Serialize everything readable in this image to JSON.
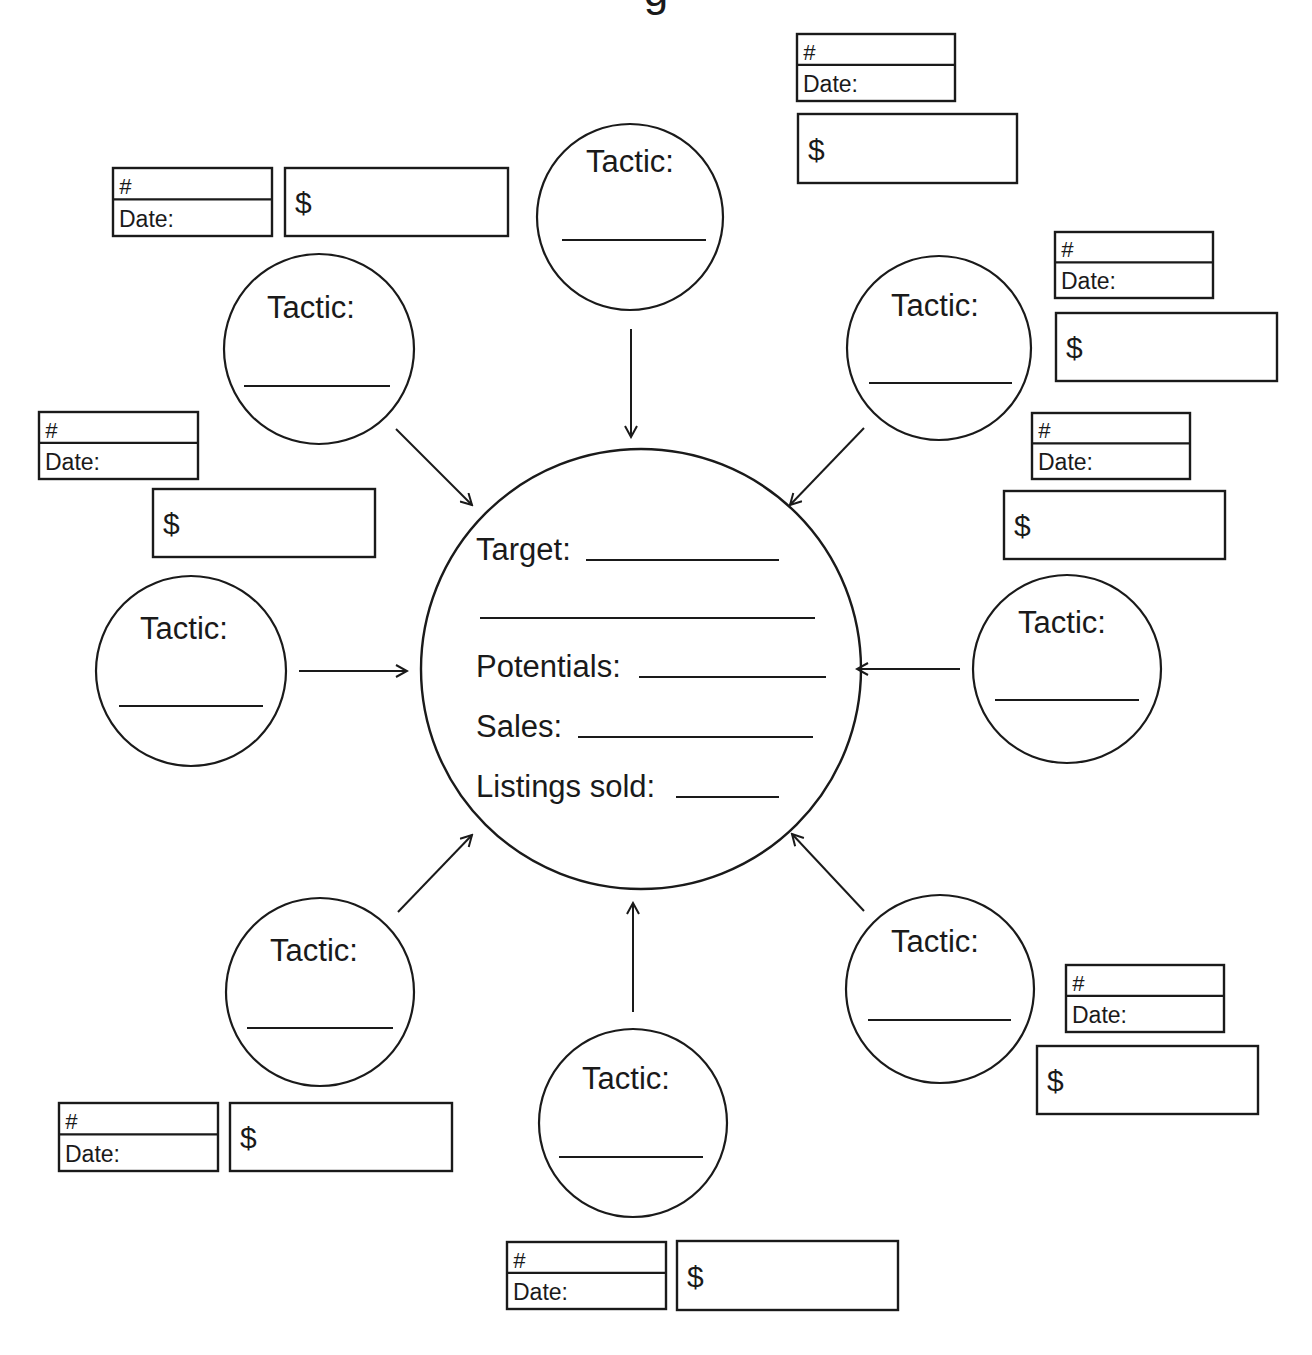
{
  "colors": {
    "ink": "#1a1a1a",
    "background": "#ffffff"
  },
  "center": {
    "cx": 641,
    "cy": 669,
    "r": 220,
    "fields": [
      {
        "label": "Target:",
        "x": 476,
        "y": 560,
        "line": [
          586,
          779
        ]
      },
      {
        "label": "",
        "x": 480,
        "y": 618,
        "line": [
          480,
          815
        ]
      },
      {
        "label": "Potentials:",
        "x": 476,
        "y": 677,
        "line": [
          639,
          826
        ]
      },
      {
        "label": "Sales:",
        "x": 476,
        "y": 737,
        "line": [
          578,
          813
        ]
      },
      {
        "label": "Listings sold:",
        "x": 476,
        "y": 797,
        "line": [
          676,
          779
        ]
      }
    ]
  },
  "tactic_label": "Tactic:",
  "tactics": [
    {
      "id": "top",
      "cx": 630,
      "cy": 217,
      "r": 93,
      "label_x": 630,
      "label_y": 172,
      "line": [
        562,
        706,
        240
      ],
      "arrow": [
        631,
        329,
        631,
        437
      ]
    },
    {
      "id": "upper-right",
      "cx": 939,
      "cy": 348,
      "r": 92,
      "label_x": 935,
      "label_y": 316,
      "line": [
        869,
        1012,
        383
      ],
      "arrow": [
        864,
        428,
        790,
        505
      ]
    },
    {
      "id": "right",
      "cx": 1067,
      "cy": 669,
      "r": 94,
      "label_x": 1062,
      "label_y": 633,
      "line": [
        995,
        1139,
        700
      ],
      "arrow": [
        960,
        669,
        857,
        669
      ]
    },
    {
      "id": "lower-right",
      "cx": 940,
      "cy": 989,
      "r": 94,
      "label_x": 935,
      "label_y": 952,
      "line": [
        868,
        1011,
        1020
      ],
      "arrow": [
        864,
        911,
        792,
        834
      ]
    },
    {
      "id": "bottom",
      "cx": 633,
      "cy": 1123,
      "r": 94,
      "label_x": 626,
      "label_y": 1089,
      "line": [
        559,
        703,
        1157
      ],
      "arrow": [
        633,
        1012,
        633,
        903
      ]
    },
    {
      "id": "lower-left",
      "cx": 320,
      "cy": 992,
      "r": 94,
      "label_x": 314,
      "label_y": 961,
      "line": [
        247,
        393,
        1028
      ],
      "arrow": [
        398,
        912,
        472,
        835
      ]
    },
    {
      "id": "left",
      "cx": 191,
      "cy": 671,
      "r": 95,
      "label_x": 184,
      "label_y": 639,
      "line": [
        119,
        263,
        706
      ],
      "arrow": [
        299,
        671,
        407,
        671
      ]
    },
    {
      "id": "upper-left",
      "cx": 319,
      "cy": 349,
      "r": 95,
      "label_x": 311,
      "label_y": 318,
      "line": [
        244,
        390,
        386
      ],
      "arrow": [
        396,
        429,
        472,
        505
      ]
    }
  ],
  "record_box": {
    "number_label": "#",
    "date_label": "Date:",
    "amount_label": "$"
  },
  "boxes": [
    {
      "id": "top",
      "nd": [
        797,
        34,
        158,
        67
      ],
      "amt": [
        798,
        114,
        219,
        69
      ]
    },
    {
      "id": "upper-left",
      "nd": [
        113,
        168,
        159,
        68
      ],
      "amt": [
        285,
        168,
        223,
        68
      ]
    },
    {
      "id": "upper-right",
      "nd": [
        1055,
        232,
        158,
        66
      ],
      "amt": [
        1056,
        313,
        221,
        68
      ]
    },
    {
      "id": "left",
      "nd": [
        39,
        412,
        159,
        67
      ],
      "amt": [
        153,
        489,
        222,
        68
      ]
    },
    {
      "id": "right",
      "nd": [
        1032,
        413,
        158,
        66
      ],
      "amt": [
        1004,
        491,
        221,
        68
      ]
    },
    {
      "id": "lower-right",
      "nd": [
        1066,
        965,
        158,
        67
      ],
      "amt": [
        1037,
        1046,
        221,
        68
      ]
    },
    {
      "id": "lower-left",
      "nd": [
        59,
        1103,
        159,
        68
      ],
      "amt": [
        230,
        1103,
        222,
        68
      ]
    },
    {
      "id": "bottom",
      "nd": [
        507,
        1242,
        159,
        67
      ],
      "amt": [
        677,
        1241,
        221,
        69
      ]
    }
  ],
  "title_fragment": "g"
}
